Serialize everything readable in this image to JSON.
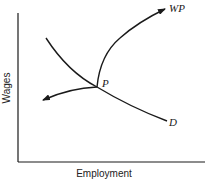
{
  "diagram": {
    "x_axis_label": "Employment",
    "y_axis_label": "Wages",
    "curves": [
      {
        "id": "D",
        "label": "D",
        "description": "downward-sloping demand curve"
      },
      {
        "id": "WP",
        "label": "WP",
        "description": "curve rising from P with arrow toward upper right"
      },
      {
        "id": "left-arrow",
        "label": "",
        "description": "curve from P with arrow toward the left"
      }
    ],
    "points": [
      {
        "id": "P",
        "label": "P"
      }
    ],
    "colors": {
      "line": "#1a1a1a",
      "background": "#ffffff"
    }
  }
}
